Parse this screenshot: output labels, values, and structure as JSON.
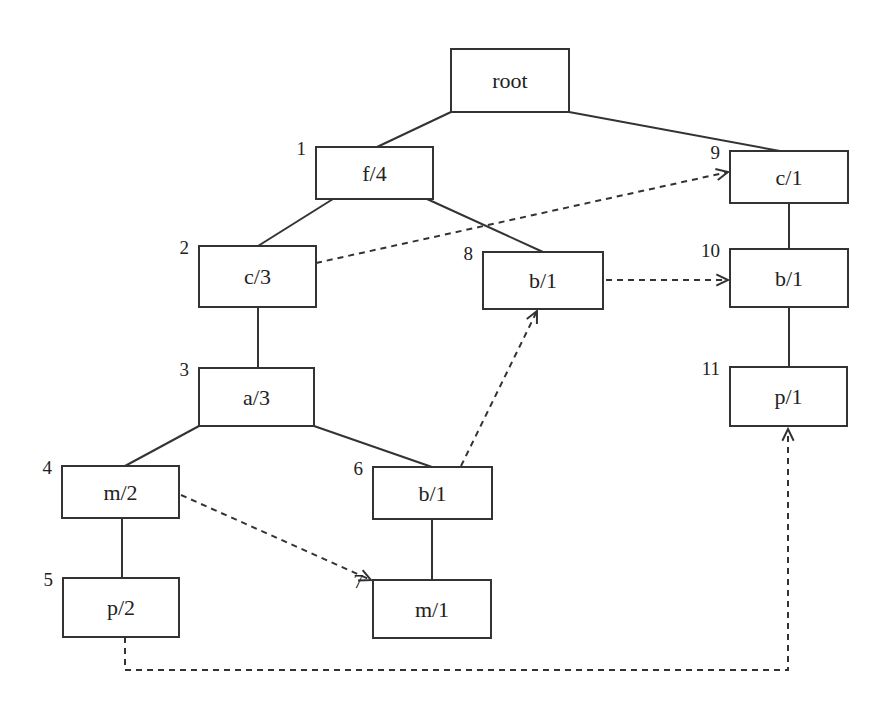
{
  "diagram": {
    "type": "fp-tree",
    "nodes": [
      {
        "id": "root",
        "label": "root",
        "index": "",
        "x": 451,
        "y": 49,
        "w": 118,
        "h": 63
      },
      {
        "id": "n1",
        "label": "f/4",
        "index": "1",
        "x": 316,
        "y": 147,
        "w": 117,
        "h": 52
      },
      {
        "id": "n2",
        "label": "c/3",
        "index": "2",
        "x": 199,
        "y": 246,
        "w": 117,
        "h": 61
      },
      {
        "id": "n3",
        "label": "a/3",
        "index": "3",
        "x": 199,
        "y": 368,
        "w": 115,
        "h": 58
      },
      {
        "id": "n4",
        "label": "m/2",
        "index": "4",
        "x": 62,
        "y": 466,
        "w": 117,
        "h": 52
      },
      {
        "id": "n5",
        "label": "p/2",
        "index": "5",
        "x": 63,
        "y": 578,
        "w": 116,
        "h": 59
      },
      {
        "id": "n6",
        "label": "b/1",
        "index": "6",
        "x": 373,
        "y": 467,
        "w": 119,
        "h": 52
      },
      {
        "id": "n7",
        "label": "m/1",
        "index": "7",
        "x": 373,
        "y": 580,
        "w": 118,
        "h": 58
      },
      {
        "id": "n8",
        "label": "b/1",
        "index": "8",
        "x": 483,
        "y": 252,
        "w": 120,
        "h": 57
      },
      {
        "id": "n9",
        "label": "c/1",
        "index": "9",
        "x": 730,
        "y": 151,
        "w": 118,
        "h": 52
      },
      {
        "id": "n10",
        "label": "b/1",
        "index": "10",
        "x": 730,
        "y": 249,
        "w": 118,
        "h": 58
      },
      {
        "id": "n11",
        "label": "p/1",
        "index": "11",
        "x": 730,
        "y": 367,
        "w": 117,
        "h": 59
      }
    ],
    "edges": [
      {
        "from": "root",
        "to": "n1",
        "points": [
          [
            451,
            112
          ],
          [
            377,
            147
          ]
        ]
      },
      {
        "from": "root",
        "to": "n9",
        "points": [
          [
            569,
            112
          ],
          [
            780,
            151
          ]
        ]
      },
      {
        "from": "n1",
        "to": "n2",
        "points": [
          [
            333,
            199
          ],
          [
            258,
            246
          ]
        ]
      },
      {
        "from": "n1",
        "to": "n8",
        "points": [
          [
            427,
            199
          ],
          [
            543,
            252
          ]
        ]
      },
      {
        "from": "n2",
        "to": "n3",
        "points": [
          [
            258,
            307
          ],
          [
            258,
            368
          ]
        ]
      },
      {
        "from": "n3",
        "to": "n4",
        "points": [
          [
            199,
            426
          ],
          [
            125,
            466
          ]
        ]
      },
      {
        "from": "n3",
        "to": "n6",
        "points": [
          [
            314,
            426
          ],
          [
            432,
            467
          ]
        ]
      },
      {
        "from": "n4",
        "to": "n5",
        "points": [
          [
            122,
            518
          ],
          [
            122,
            578
          ]
        ]
      },
      {
        "from": "n6",
        "to": "n7",
        "points": [
          [
            432,
            519
          ],
          [
            432,
            580
          ]
        ]
      },
      {
        "from": "n9",
        "to": "n10",
        "points": [
          [
            789,
            203
          ],
          [
            789,
            249
          ]
        ]
      },
      {
        "from": "n10",
        "to": "n11",
        "points": [
          [
            789,
            307
          ],
          [
            789,
            367
          ]
        ]
      }
    ],
    "node_links": [
      {
        "item": "c",
        "from": "n2",
        "to": "n9",
        "points": [
          [
            316,
            263
          ],
          [
            728,
            172
          ]
        ],
        "arrow": "right"
      },
      {
        "item": "b",
        "from": "n8",
        "to": "n10",
        "points": [
          [
            606,
            280
          ],
          [
            728,
            280
          ]
        ],
        "arrow": "right"
      },
      {
        "item": "b",
        "from": "n6",
        "to": "n8",
        "points": [
          [
            461,
            466
          ],
          [
            537,
            311
          ]
        ],
        "arrow": "up"
      },
      {
        "item": "m",
        "from": "n4",
        "to": "n7",
        "points": [
          [
            181,
            495
          ],
          [
            371,
            580
          ]
        ],
        "arrow": "down-right"
      },
      {
        "item": "p",
        "from": "n5",
        "to": "n11",
        "points": [
          [
            125,
            637
          ],
          [
            125,
            670
          ],
          [
            788,
            670
          ],
          [
            788,
            429
          ]
        ],
        "arrow": "up"
      }
    ]
  }
}
